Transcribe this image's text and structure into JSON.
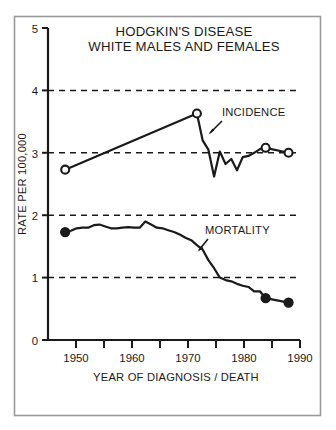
{
  "figure": {
    "frame_color": "#9a9a9a",
    "background": "#ffffff",
    "ink_color": "#1a1a1a"
  },
  "chart_data": {
    "type": "line",
    "title": "HODGKIN'S DISEASE",
    "subtitle": "WHITE MALES AND FEMALES",
    "xlabel": "YEAR OF DIAGNOSIS / DEATH",
    "ylabel": "RATE PER 100,000",
    "xlim": [
      1947,
      1991
    ],
    "ylim": [
      0,
      5
    ],
    "grid": true,
    "grid_values": [
      1,
      2,
      3,
      4
    ],
    "grid_style": "dashed",
    "legend_position": "inline-annotations",
    "x_ticks_major": [
      1950,
      1960,
      1970,
      1980,
      1990
    ],
    "x_ticks_major_labels": [
      "1950",
      "1960",
      "1970",
      "1980",
      "1990"
    ],
    "x_ticks_minor": [
      1955,
      1965,
      1975,
      1985
    ],
    "y_ticks": [
      0,
      1,
      2,
      3,
      4,
      5
    ],
    "y_tick_labels": [
      "0",
      "1",
      "2",
      "3",
      "4",
      "5"
    ],
    "series": [
      {
        "name": "INCIDENCE",
        "marker": "open-circle",
        "annotation": "INCIDENCE",
        "x": [
          1950,
          1973,
          1974,
          1975,
          1976,
          1977,
          1978,
          1979,
          1980,
          1981,
          1982,
          1983,
          1984,
          1985,
          1989
        ],
        "values": [
          2.73,
          3.63,
          3.2,
          3.05,
          2.62,
          3.02,
          2.82,
          2.9,
          2.72,
          2.93,
          2.95,
          3.0,
          3.06,
          3.08,
          3.0
        ],
        "marker_points": [
          {
            "x": 1950,
            "y": 2.73
          },
          {
            "x": 1973,
            "y": 3.63
          },
          {
            "x": 1985,
            "y": 3.08
          },
          {
            "x": 1989,
            "y": 3.0
          }
        ]
      },
      {
        "name": "MORTALITY",
        "marker": "filled-circle",
        "annotation": "MORTALITY",
        "x": [
          1950,
          1951,
          1952,
          1953,
          1954,
          1955,
          1956,
          1957,
          1958,
          1959,
          1960,
          1961,
          1962,
          1963,
          1964,
          1965,
          1966,
          1967,
          1968,
          1969,
          1970,
          1971,
          1972,
          1973,
          1974,
          1975,
          1976,
          1977,
          1978,
          1979,
          1980,
          1981,
          1982,
          1983,
          1984,
          1985,
          1989
        ],
        "values": [
          1.73,
          1.75,
          1.79,
          1.8,
          1.8,
          1.84,
          1.85,
          1.82,
          1.79,
          1.79,
          1.8,
          1.81,
          1.8,
          1.8,
          1.9,
          1.85,
          1.8,
          1.79,
          1.76,
          1.73,
          1.69,
          1.64,
          1.6,
          1.52,
          1.45,
          1.28,
          1.15,
          1.0,
          0.96,
          0.94,
          0.9,
          0.87,
          0.85,
          0.78,
          0.78,
          0.67,
          0.6
        ],
        "marker_points": [
          {
            "x": 1950,
            "y": 1.73
          },
          {
            "x": 1985,
            "y": 0.67
          },
          {
            "x": 1989,
            "y": 0.6
          }
        ]
      }
    ],
    "annotations": [
      {
        "text": "INCIDENCE",
        "x": 1977,
        "y": 3.55,
        "arrow_to": {
          "x": 1974.2,
          "y": 3.25
        }
      },
      {
        "text": "MORTALITY",
        "x": 1976.5,
        "y": 1.72,
        "arrow_to": {
          "x": 1974.0,
          "y": 1.45
        }
      }
    ]
  }
}
